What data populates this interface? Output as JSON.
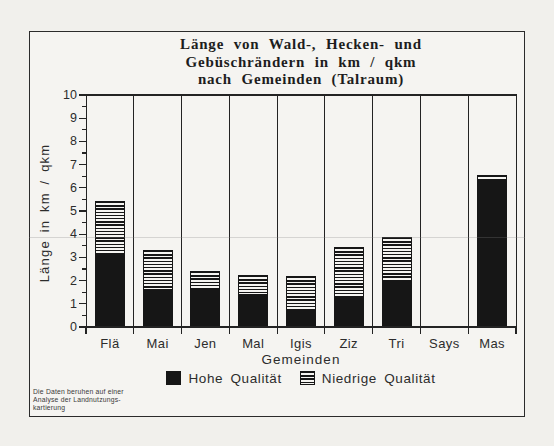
{
  "window": {
    "width": 554,
    "height": 446
  },
  "title": {
    "line1": "Länge von Wald-, Hecken- und",
    "line2": "Gebüschrändern in km / qkm",
    "line3": "nach Gemeinden (Talraum)"
  },
  "chart_data": {
    "type": "bar",
    "stacked": true,
    "title": "Länge von Wald-, Hecken- und Gebüschrändern in km / qkm nach Gemeinden (Talraum)",
    "xlabel": "Gemeinden",
    "ylabel": "Länge in km / qkm",
    "ylim": [
      0,
      10
    ],
    "ytick_step": 1,
    "y_ticks": [
      "0",
      "1",
      "2",
      "3",
      "4",
      "5",
      "6",
      "7",
      "8",
      "9",
      "10"
    ],
    "grid": "vertical-cell-dividers",
    "legend_position": "bottom",
    "categories": [
      "Flä",
      "Mai",
      "Jen",
      "Mal",
      "Igis",
      "Ziz",
      "Tri",
      "Says",
      "Mas"
    ],
    "series": [
      {
        "name": "Hohe Qualität",
        "pattern": "solid-black",
        "values": [
          3.1,
          1.6,
          1.6,
          1.4,
          0.75,
          1.3,
          2.0,
          0,
          6.25
        ]
      },
      {
        "name": "Niedrige Qualität",
        "pattern": "horizontal-stripes",
        "values": [
          2.35,
          1.7,
          0.8,
          0.85,
          1.45,
          2.15,
          1.9,
          0,
          0.3
        ]
      }
    ],
    "totals": [
      5.45,
      3.3,
      2.4,
      2.25,
      2.2,
      3.45,
      3.9,
      0,
      6.55
    ]
  },
  "footnote": {
    "line1": "Die Daten beruhen auf einer",
    "line2": "Analyse der Landnutzungs-",
    "line3": "kartierung"
  },
  "colors": {
    "bar_fill": "#161616",
    "stripe_color": "#161616",
    "axis_color": "#232323",
    "background": "#f1f0ec",
    "paper": "#f5f4f1"
  }
}
